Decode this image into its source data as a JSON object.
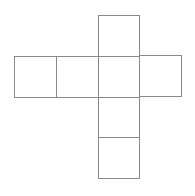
{
  "diagram": {
    "type": "cube-net",
    "line_color": "#8a8a8a",
    "background": "#ffffff",
    "faces": [
      {
        "id": "top",
        "x": 98,
        "y": 15,
        "w": 42,
        "h": 42
      },
      {
        "id": "far-left",
        "x": 14,
        "y": 56,
        "w": 43,
        "h": 42
      },
      {
        "id": "left",
        "x": 56,
        "y": 56,
        "w": 43,
        "h": 42
      },
      {
        "id": "center",
        "x": 98,
        "y": 56,
        "w": 42,
        "h": 42
      },
      {
        "id": "right",
        "x": 139,
        "y": 55,
        "w": 43,
        "h": 42
      },
      {
        "id": "below",
        "x": 98,
        "y": 97,
        "w": 42,
        "h": 41
      },
      {
        "id": "bottom",
        "x": 98,
        "y": 137,
        "w": 42,
        "h": 42
      }
    ]
  }
}
